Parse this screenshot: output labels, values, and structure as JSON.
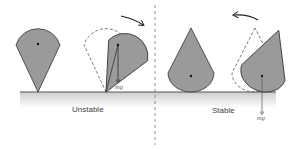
{
  "labels": {
    "unstable": "Unstable",
    "stable": "Stable",
    "mg_left": "mg",
    "mg_right": "mg"
  },
  "colors": {
    "shape_fill": "#9a9a9a",
    "shape_stroke": "#333333",
    "dashed_outline": "#555555",
    "ground_line": "#555555",
    "ground_shade_top": "#cfcfcf",
    "ground_shade_bottom": "#ffffff",
    "divider": "#666666",
    "arrow": "#333333"
  },
  "panels": [
    {
      "name": "unstable",
      "shapes": [
        "inverted-cone-upright",
        "inverted-cone-tilted"
      ],
      "rotation_arrow": "clockwise"
    },
    {
      "name": "stable",
      "shapes": [
        "cone-upright",
        "cone-tilted"
      ],
      "rotation_arrow": "counterclockwise"
    }
  ]
}
